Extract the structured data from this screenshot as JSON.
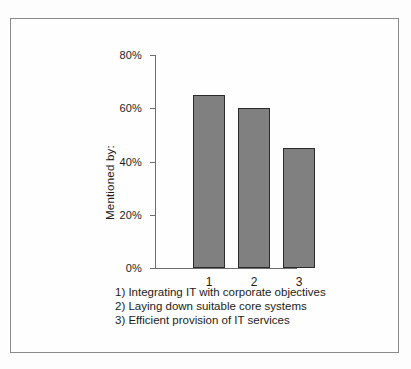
{
  "chart_data": {
    "type": "bar",
    "title": "",
    "xlabel": "",
    "ylabel": "Mentioned by:",
    "categories": [
      "1",
      "2",
      "3"
    ],
    "values": [
      65,
      60,
      45
    ],
    "ylim": [
      0,
      80
    ],
    "yticks": [
      "0%",
      "20%",
      "40%",
      "60%",
      "80%"
    ],
    "ytick_values": [
      0,
      20,
      40,
      60,
      80
    ],
    "grid": false,
    "legend_position": "below-axis",
    "bar_color": "#808080",
    "bar_edge_color": "#2b2b2b",
    "axis_color": "#6e6e6e",
    "frame_color": "#8a8a8a",
    "annotations": [
      "1) Integrating IT with corporate objectives",
      "2) Laying down suitable core systems",
      "3) Efficient provision of IT services"
    ]
  },
  "legend": {
    "items": [
      {
        "label": "1) Integrating IT with corporate objectives"
      },
      {
        "label": "2) Laying down suitable core systems"
      },
      {
        "label": "3) Efficient provision of IT services"
      }
    ]
  }
}
